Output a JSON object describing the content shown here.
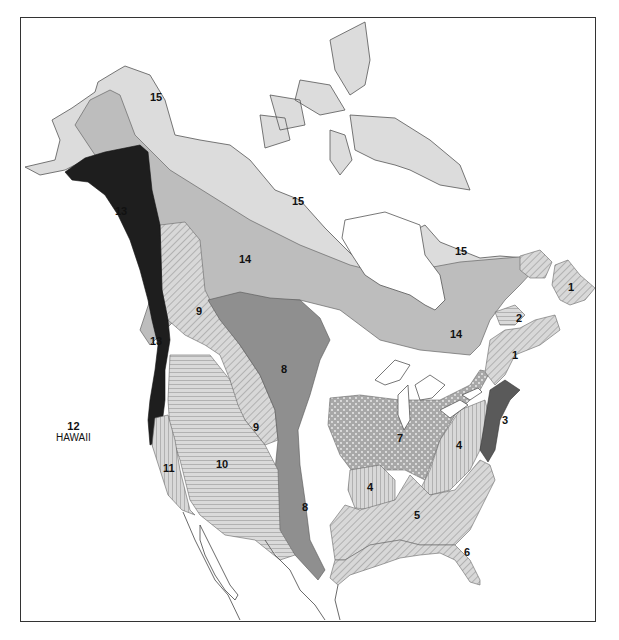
{
  "map": {
    "title": "",
    "colors": {
      "zone15": "#dcdcdc",
      "zone14": "#bdbdbd",
      "zone13": "#1e1e1e",
      "zone8": "#8f8f8f",
      "zone3": "#5a5a5a",
      "hatch_light": "#d6d6d6",
      "stroke": "#555555",
      "water": "#ffffff"
    },
    "zones": [
      {
        "id": "1",
        "label": "1",
        "pattern": "diagonal-hatch"
      },
      {
        "id": "2",
        "label": "2",
        "pattern": "horizontal-hatch"
      },
      {
        "id": "3",
        "label": "3",
        "pattern": "dark-solid"
      },
      {
        "id": "4",
        "label": "4",
        "pattern": "vertical-hatch"
      },
      {
        "id": "5",
        "label": "5",
        "pattern": "diagonal-hatch"
      },
      {
        "id": "6",
        "label": "6",
        "pattern": "diagonal-hatch"
      },
      {
        "id": "7",
        "label": "7",
        "pattern": "dotted"
      },
      {
        "id": "8",
        "label": "8",
        "pattern": "medium-solid"
      },
      {
        "id": "9",
        "label": "9",
        "pattern": "diagonal-hatch"
      },
      {
        "id": "10",
        "label": "10",
        "pattern": "horizontal-hatch"
      },
      {
        "id": "11",
        "label": "11",
        "pattern": "vertical-hatch"
      },
      {
        "id": "12",
        "label": "12",
        "pattern": "none"
      },
      {
        "id": "13",
        "label": "13",
        "pattern": "black-solid"
      },
      {
        "id": "14",
        "label": "14",
        "pattern": "light-solid"
      },
      {
        "id": "15",
        "label": "15",
        "pattern": "very-light-solid"
      }
    ],
    "labels": {
      "z15_alaska": "15",
      "z15_north": "15",
      "z15_quebec": "15",
      "z13_alaska": "13",
      "z13_wa": "13",
      "z14_west": "14",
      "z14_east": "14",
      "z9_bc": "9",
      "z9_rockies": "9",
      "z8_plains": "8",
      "z8_texas": "8",
      "z10": "10",
      "z11": "11",
      "z7": "7",
      "z4_ky": "4",
      "z4_app": "4",
      "z5": "5",
      "z6": "6",
      "z3": "3",
      "z2": "2",
      "z1_newfoundland": "1",
      "z1_maritimes": "1",
      "hawaii_number": "12",
      "hawaii_name": "HAWAII"
    }
  }
}
